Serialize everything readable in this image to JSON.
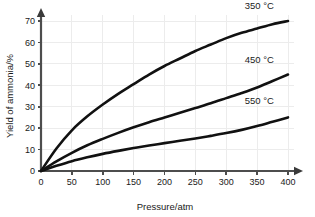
{
  "chart_data": {
    "type": "line",
    "title": "",
    "xlabel": "Pressure/atm",
    "ylabel": "Yield of ammonia/%",
    "xlim": [
      0,
      400
    ],
    "ylim": [
      0,
      75
    ],
    "xticks": [
      0,
      50,
      100,
      150,
      200,
      250,
      300,
      350,
      400
    ],
    "yticks": [
      0,
      10,
      20,
      30,
      40,
      50,
      60,
      70
    ],
    "xtick_labels": [
      "0",
      "50",
      "100",
      "150",
      "200",
      "250",
      "300",
      "350",
      "400"
    ],
    "ytick_labels": [
      "0",
      "10",
      "20",
      "30",
      "40",
      "50",
      "60",
      "70"
    ],
    "grid": true,
    "legend_position": "inline-right-of-curve",
    "x": [
      0,
      25,
      50,
      75,
      100,
      125,
      150,
      175,
      200,
      225,
      250,
      275,
      300,
      325,
      350,
      375,
      400
    ],
    "series": [
      {
        "name": "350 °C",
        "label": "350 °C",
        "color": "#111111",
        "values": [
          0,
          10.5,
          19.0,
          25.5,
          31.0,
          36.0,
          40.5,
          45.0,
          49.0,
          52.5,
          56.0,
          59.0,
          62.0,
          64.5,
          66.5,
          68.5,
          70.0
        ],
        "label_x": 330,
        "label_y": 75.5
      },
      {
        "name": "450 °C",
        "label": "450 °C",
        "color": "#111111",
        "values": [
          0,
          4.5,
          8.5,
          12.0,
          15.0,
          17.8,
          20.4,
          22.8,
          25.0,
          27.2,
          29.4,
          31.6,
          34.0,
          36.4,
          39.0,
          42.0,
          45.0
        ],
        "label_x": 330,
        "label_y": 50.5
      },
      {
        "name": "550 °C",
        "label": "550 °C",
        "color": "#111111",
        "values": [
          0,
          2.4,
          4.6,
          6.4,
          8.0,
          9.4,
          10.7,
          11.9,
          13.0,
          14.1,
          15.2,
          16.4,
          17.7,
          19.2,
          21.0,
          23.0,
          25.0
        ],
        "label_x": 330,
        "label_y": 31.5
      }
    ],
    "annotations": [
      {
        "text": "350 °C",
        "x": 330,
        "y": 75.5
      },
      {
        "text": "450 °C",
        "x": 330,
        "y": 50.5
      },
      {
        "text": "550 °C",
        "x": 330,
        "y": 31.5
      }
    ],
    "colors": {
      "curve": "#111111",
      "axis": "#4d4d4d",
      "grid": "#ececec",
      "text": "#1a1a1a",
      "background": "#ffffff"
    }
  }
}
